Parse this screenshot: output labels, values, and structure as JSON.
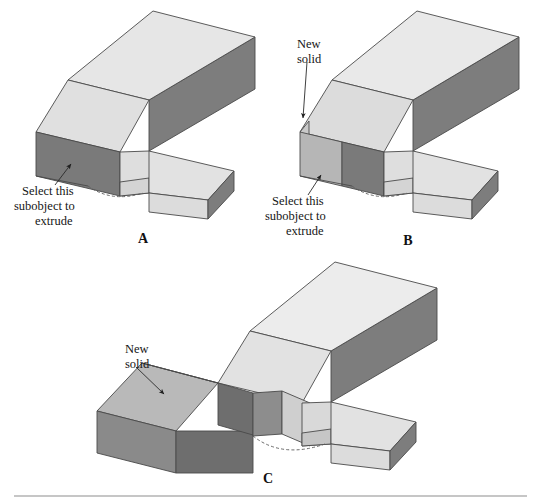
{
  "figure": {
    "background_color": "#ffffff",
    "panels": [
      {
        "id": "A",
        "label": "A",
        "label_pos": {
          "x": 143,
          "y": 243
        },
        "callout": {
          "name": "select-subobject-callout",
          "lines": [
            "Select this",
            "subobject to",
            "extrude"
          ],
          "text_pos": {
            "x": 14,
            "y": 190
          },
          "arrow_from": {
            "x": 55,
            "y": 185
          },
          "arrow_to": {
            "x": 71,
            "y": 163
          }
        }
      },
      {
        "id": "B",
        "label": "B",
        "label_pos": {
          "x": 408,
          "y": 240
        },
        "callouts": [
          {
            "name": "new-solid-callout",
            "lines": [
              "New",
              "solid"
            ],
            "text_pos": {
              "x": 297,
              "y": 42
            },
            "arrow_from": {
              "x": 307,
              "y": 62
            },
            "arrow_to": {
              "x": 302,
              "y": 120
            }
          },
          {
            "name": "select-subobject-callout",
            "lines": [
              "Select this",
              "subobject to",
              "extrude"
            ],
            "text_pos": {
              "x": 267,
              "y": 199
            },
            "arrow_from": {
              "x": 308,
              "y": 194
            },
            "arrow_to": {
              "x": 320,
              "y": 174
            }
          }
        ]
      },
      {
        "id": "C",
        "label": "C",
        "label_pos": {
          "x": 268,
          "y": 478
        },
        "callout": {
          "name": "new-solid-callout",
          "lines": [
            "New",
            "solid"
          ],
          "text_pos": {
            "x": 125,
            "y": 347
          },
          "arrow_from": {
            "x": 136,
            "y": 366
          },
          "arrow_to": {
            "x": 165,
            "y": 395
          }
        }
      }
    ],
    "colors": {
      "top_light": "#e3e3e3",
      "top_lighter": "#ededed",
      "side_dark": "#7d7d7d",
      "side_mid": "#b4b4b4",
      "side_midlight": "#c9c9c9",
      "face_selected": "#d6d6d6",
      "outline": "#4a4a4a",
      "hidden_edge": "#5a5a5a",
      "rule": "#8e8e8e",
      "text": "#161616"
    },
    "footer_rule": {
      "y": 494,
      "x1": 14,
      "x2": 527
    }
  }
}
